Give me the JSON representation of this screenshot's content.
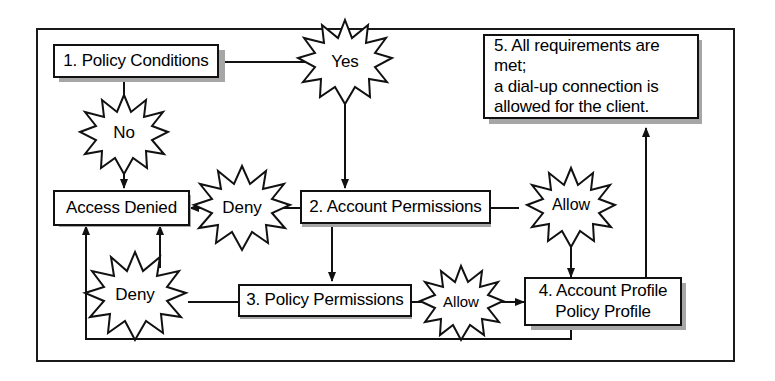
{
  "diagram": {
    "type": "flowchart",
    "frame": {
      "border_color": "#1a1a1a"
    },
    "style": {
      "box_fill": "#ffffff",
      "box_border": "#111111",
      "shadow_color": "#a6a6a6",
      "line_color": "#111111",
      "burst_fill": "#ffffff",
      "burst_border": "#111111"
    },
    "nodes": [
      {
        "id": "node-1",
        "name": "policy-conditions",
        "label": "1. Policy Conditions",
        "lines": [
          "1. Policy Conditions"
        ]
      },
      {
        "id": "node-access-denied",
        "name": "access-denied",
        "label": "Access Denied",
        "lines": [
          "Access Denied"
        ]
      },
      {
        "id": "node-2",
        "name": "account-permissions",
        "label": "2. Account Permissions",
        "lines": [
          "2. Account Permissions"
        ]
      },
      {
        "id": "node-3",
        "name": "policy-permissions",
        "label": "3. Policy Permissions",
        "lines": [
          "3. Policy Permissions"
        ]
      },
      {
        "id": "node-4",
        "name": "account-profile-policy-profile",
        "label": "4. Account Profile Policy Profile",
        "lines": [
          "4. Account Profile",
          "Policy Profile"
        ]
      },
      {
        "id": "node-5",
        "name": "all-requirements-met",
        "label": "5. All requirements are met; a dial-up connection is allowed for the client.",
        "lines": [
          "5. All requirements are met;",
          "a dial-up connection is",
          "allowed for the client."
        ]
      }
    ],
    "decision_bursts": [
      {
        "id": "burst-yes",
        "name": "yes-burst",
        "label": "Yes"
      },
      {
        "id": "burst-no",
        "name": "no-burst",
        "label": "No"
      },
      {
        "id": "burst-deny-account",
        "name": "deny-account-burst",
        "label": "Deny"
      },
      {
        "id": "burst-allow-account",
        "name": "allow-account-burst",
        "label": "Allow"
      },
      {
        "id": "burst-deny-policy",
        "name": "deny-policy-burst",
        "label": "Deny"
      },
      {
        "id": "burst-allow-policy",
        "name": "allow-policy-burst",
        "label": "Allow"
      }
    ],
    "edges": [
      {
        "from": "node-1",
        "to": "burst-yes",
        "label": "Yes"
      },
      {
        "from": "burst-yes",
        "to": "node-2",
        "label": ""
      },
      {
        "from": "node-1",
        "to": "node-access-denied",
        "label": "No"
      },
      {
        "from": "node-2",
        "to": "node-access-denied",
        "label": "Deny"
      },
      {
        "from": "node-2",
        "to": "node-4",
        "label": "Allow"
      },
      {
        "from": "node-2",
        "to": "node-3",
        "label": ""
      },
      {
        "from": "node-3",
        "to": "node-access-denied",
        "label": "Deny"
      },
      {
        "from": "node-3",
        "to": "node-4",
        "label": "Allow"
      },
      {
        "from": "node-4",
        "to": "node-5",
        "label": ""
      },
      {
        "from": "node-4",
        "to": "node-access-denied",
        "label": ""
      }
    ]
  }
}
